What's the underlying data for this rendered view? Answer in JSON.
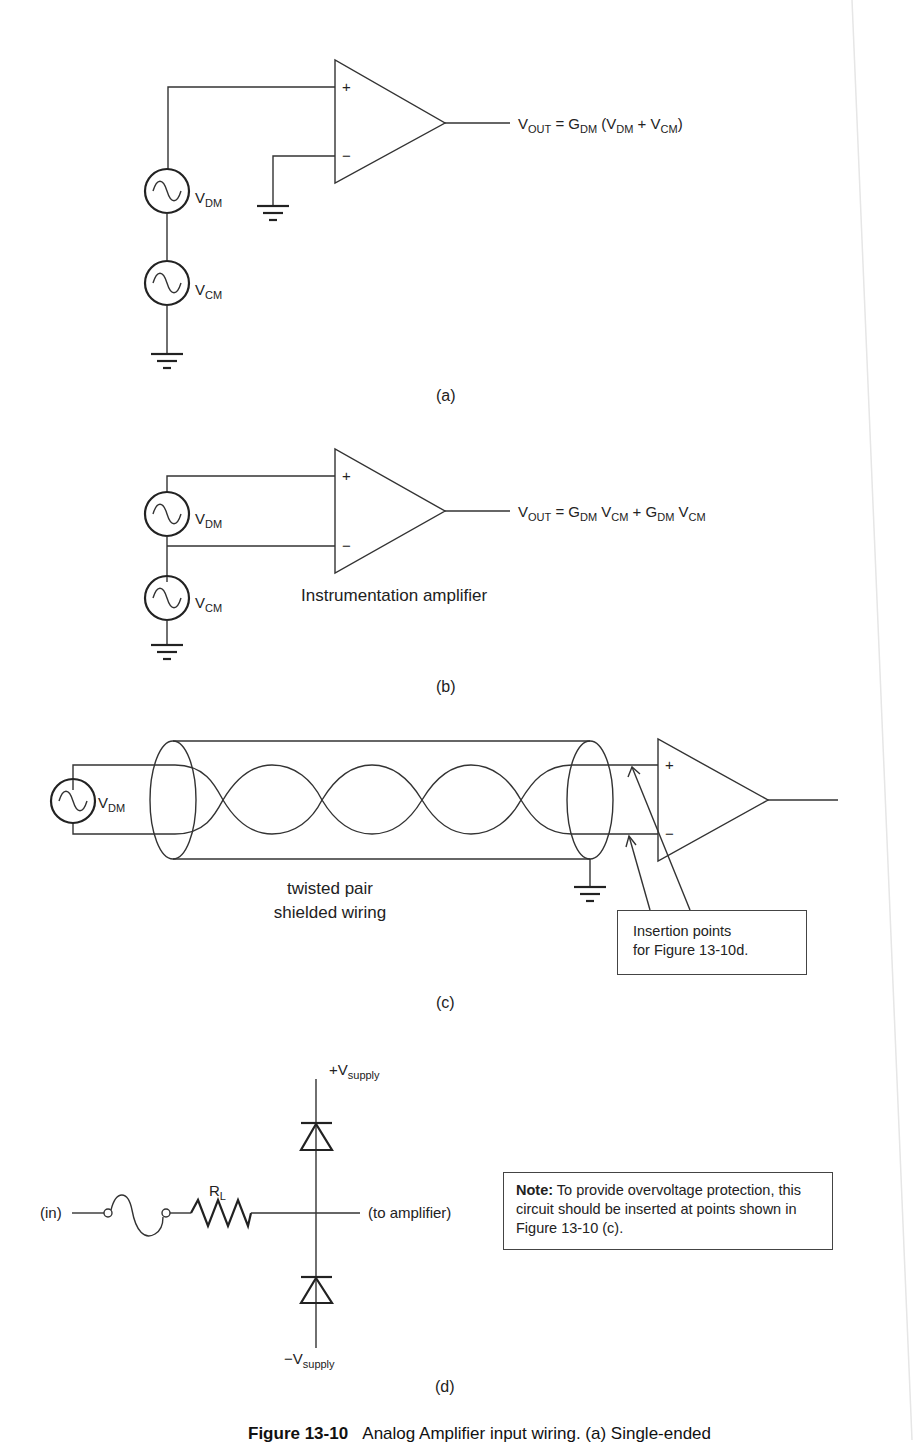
{
  "figure": {
    "number": "Figure 13-10",
    "caption_visible": "Analog Amplifier input wiring. (a) Single-ended",
    "panels": [
      {
        "id": "a",
        "label": "(a)",
        "sources": [
          {
            "name": "V",
            "sub": "DM"
          },
          {
            "name": "V",
            "sub": "CM"
          }
        ],
        "inputs": [
          "+",
          "−"
        ],
        "output_equation": {
          "lhs": "V",
          "lhs_sub": "OUT",
          "rhs": [
            {
              "t": " = G"
            },
            {
              "s": "DM"
            },
            {
              "t": " (V"
            },
            {
              "s": "DM"
            },
            {
              "t": " + V"
            },
            {
              "s": "CM"
            },
            {
              "t": ")"
            }
          ]
        }
      },
      {
        "id": "b",
        "label": "(b)",
        "sources": [
          {
            "name": "V",
            "sub": "DM"
          },
          {
            "name": "V",
            "sub": "CM"
          }
        ],
        "inputs": [
          "+",
          "−"
        ],
        "amplifier_label": "Instrumentation amplifier",
        "output_equation": {
          "lhs": "V",
          "lhs_sub": "OUT",
          "rhs": [
            {
              "t": " = G"
            },
            {
              "s": "DM"
            },
            {
              "t": " V"
            },
            {
              "s": "CM"
            },
            {
              "t": " + G"
            },
            {
              "s": "DM"
            },
            {
              "t": " V"
            },
            {
              "s": "CM"
            }
          ]
        }
      },
      {
        "id": "c",
        "label": "(c)",
        "source": {
          "name": "V",
          "sub": "DM"
        },
        "inputs": [
          "+",
          "−"
        ],
        "cable_label_line1": "twisted pair",
        "cable_label_line2": "shielded wiring",
        "callout_line1": "Insertion points",
        "callout_line2": "for Figure 13-10d."
      },
      {
        "id": "d",
        "label": "(d)",
        "input_label": "(in)",
        "output_label": "(to amplifier)",
        "resistor": {
          "name": "R",
          "sub": "L"
        },
        "supply_pos": {
          "name": "+V",
          "sub": "supply"
        },
        "supply_neg": {
          "name": "−V",
          "sub": "supply"
        },
        "note_bold": "Note:",
        "note_text": " To provide overvoltage protection, this circuit should be inserted at points shown in Figure 13-10 (c)."
      }
    ]
  },
  "colors": {
    "line": "#333333",
    "text": "#222222",
    "background": "#ffffff"
  }
}
